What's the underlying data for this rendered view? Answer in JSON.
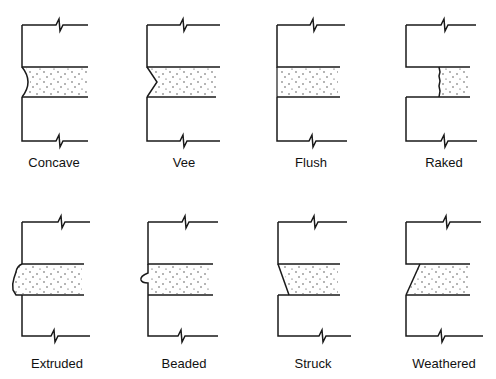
{
  "diagram": {
    "joints": [
      {
        "id": "concave",
        "label": "Concave",
        "label_x": 54,
        "label_y": 155
      },
      {
        "id": "vee",
        "label": "Vee",
        "label_x": 184,
        "label_y": 155
      },
      {
        "id": "flush",
        "label": "Flush",
        "label_x": 311,
        "label_y": 155
      },
      {
        "id": "raked",
        "label": "Raked",
        "label_x": 444,
        "label_y": 155
      },
      {
        "id": "extruded",
        "label": "Extruded",
        "label_x": 57,
        "label_y": 356
      },
      {
        "id": "beaded",
        "label": "Beaded",
        "label_x": 184,
        "label_y": 356
      },
      {
        "id": "struck",
        "label": "Struck",
        "label_x": 313,
        "label_y": 356
      },
      {
        "id": "weathered",
        "label": "Weathered",
        "label_x": 444,
        "label_y": 356
      }
    ],
    "colors": {
      "line": "#1a1a1a",
      "background": "#ffffff",
      "stipple": "#333333"
    }
  }
}
